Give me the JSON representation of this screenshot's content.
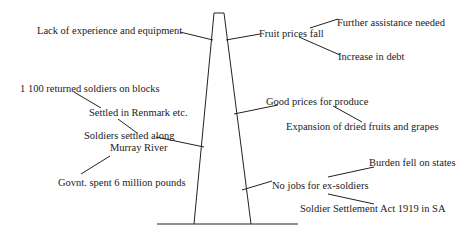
{
  "diagram": {
    "type": "force-pole",
    "colors": {
      "ink": "#222222",
      "background": "#ffffff"
    },
    "left_factors": [
      {
        "id": "lack-experience",
        "text": "Lack of experience and equipment"
      },
      {
        "id": "returned-soldiers",
        "text": "1 100 returned soldiers on blocks"
      },
      {
        "id": "settled-renmark",
        "text": "Settled in Renmark etc."
      },
      {
        "id": "settled-murray-line1",
        "text": "Soldiers settled along"
      },
      {
        "id": "settled-murray-line2",
        "text": "Murray River"
      },
      {
        "id": "govt-spent",
        "text": "Govnt. spent 6 million pounds"
      }
    ],
    "right_factors": [
      {
        "id": "fruit-prices-fall",
        "text": "Fruit prices fall"
      },
      {
        "id": "further-assistance",
        "text": "Further assistance needed"
      },
      {
        "id": "increase-debt",
        "text": "Increase in debt"
      },
      {
        "id": "good-prices",
        "text": "Good prices for produce"
      },
      {
        "id": "expansion-dried",
        "text": "Expansion of dried fruits and grapes"
      },
      {
        "id": "burden-states",
        "text": "Burden fell on states"
      },
      {
        "id": "no-jobs",
        "text": "No jobs for ex-soldiers"
      },
      {
        "id": "settlement-act",
        "text": "Soldier Settlement Act 1919 in SA"
      }
    ]
  }
}
